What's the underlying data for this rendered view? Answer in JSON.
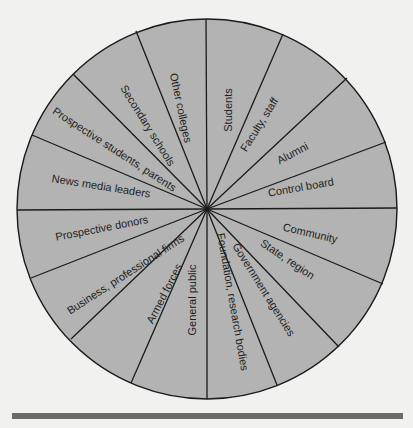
{
  "diagram": {
    "type": "publics-wheel",
    "center": [
      207,
      209
    ],
    "radius": 190,
    "fill_color": "#b3b3b3",
    "stroke_color": "#1a1a1a",
    "spoke_endpoints": [
      [
        206,
        19
      ],
      [
        283,
        34
      ],
      [
        347,
        78
      ],
      [
        386,
        142
      ],
      [
        397,
        208
      ],
      [
        383,
        284
      ],
      [
        339,
        347
      ],
      [
        277,
        385
      ],
      [
        207,
        399
      ],
      [
        131,
        383
      ],
      [
        71,
        339
      ],
      [
        31,
        278
      ],
      [
        17,
        210
      ],
      [
        32,
        135
      ],
      [
        73,
        74
      ],
      [
        136,
        31
      ]
    ],
    "segments": [
      {
        "label": "Students",
        "x": 229,
        "y": 110,
        "rotate": -90
      },
      {
        "label": "Faculty, staff",
        "x": 260,
        "y": 125,
        "rotate": -58
      },
      {
        "label": "Alumni",
        "x": 293,
        "y": 154,
        "rotate": -28
      },
      {
        "label": "Control board",
        "x": 301,
        "y": 188,
        "rotate": -10
      },
      {
        "label": "Community",
        "x": 310,
        "y": 234,
        "rotate": 13
      },
      {
        "label": "State, region",
        "x": 287,
        "y": 260,
        "rotate": 34
      },
      {
        "label": "Government agencies",
        "x": 263,
        "y": 290,
        "rotate": 58
      },
      {
        "label": "Foundation, research bodies",
        "x": 232,
        "y": 302,
        "rotate": 80
      },
      {
        "label": "General public",
        "x": 193,
        "y": 300,
        "rotate": -90
      },
      {
        "label": "Armed forces",
        "x": 165,
        "y": 294,
        "rotate": -63
      },
      {
        "label": "Business, professional firms",
        "x": 126,
        "y": 275,
        "rotate": -33
      },
      {
        "label": "Prospective donors",
        "x": 102,
        "y": 229,
        "rotate": -11
      },
      {
        "label": "News media leaders",
        "x": 101,
        "y": 187,
        "rotate": 9
      },
      {
        "label": "Prospective students, parents",
        "x": 114,
        "y": 150,
        "rotate": 33
      },
      {
        "label": "Secondary schools",
        "x": 147,
        "y": 126,
        "rotate": 58
      },
      {
        "label": "Other colleges",
        "x": 180,
        "y": 108,
        "rotate": 78
      }
    ]
  },
  "footer": {
    "rule_color": "#6b6b6b"
  }
}
